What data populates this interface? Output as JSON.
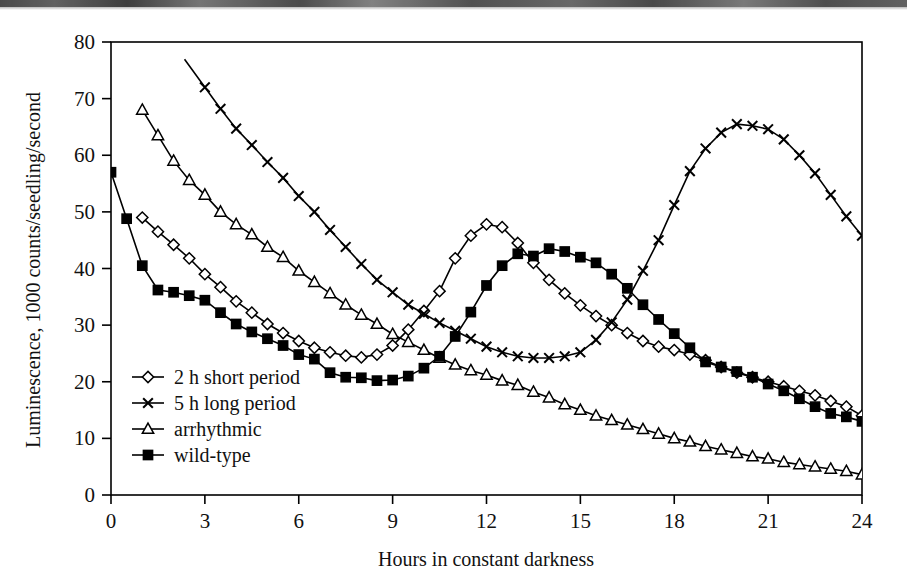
{
  "chart_data": {
    "type": "line",
    "title": "",
    "subtitle": "",
    "xlabel": "Hours in constant darkness",
    "ylabel": "Luminescence, 1000 counts/seedling/second",
    "xlim": [
      0,
      24
    ],
    "ylim": [
      0,
      80
    ],
    "xticks": [
      0,
      3,
      6,
      9,
      12,
      15,
      18,
      21,
      24
    ],
    "yticks": [
      0,
      10,
      20,
      30,
      40,
      50,
      60,
      70,
      80
    ],
    "xtick_labels": [
      "0",
      "3",
      "6",
      "9",
      "12",
      "15",
      "18",
      "21",
      "24"
    ],
    "ytick_labels": [
      "0",
      "10",
      "20",
      "30",
      "40",
      "50",
      "60",
      "70",
      "80"
    ],
    "grid": false,
    "legend_position": "inside-lower-left",
    "line_color": "#000000",
    "axis_color": "#000000",
    "series": [
      {
        "name": "2 h short period",
        "marker": "open-diamond",
        "x": [
          1.0,
          1.5,
          2.0,
          2.5,
          3.0,
          3.5,
          4.0,
          4.5,
          5.0,
          5.5,
          6.0,
          6.5,
          7.0,
          7.5,
          8.0,
          8.5,
          9.0,
          9.5,
          10.0,
          10.5,
          11.0,
          11.5,
          12.0,
          12.5,
          13.0,
          13.5,
          14.0,
          14.5,
          15.0,
          15.5,
          16.0,
          16.5,
          17.0,
          17.5,
          18.0,
          18.5,
          19.0,
          19.5,
          20.0,
          20.5,
          21.0,
          21.5,
          22.0,
          22.5,
          23.0,
          23.5,
          24.0
        ],
        "y": [
          49.0,
          46.5,
          44.2,
          41.8,
          39.0,
          36.7,
          34.2,
          32.2,
          30.2,
          28.6,
          27.2,
          26.0,
          25.2,
          24.6,
          24.3,
          24.8,
          26.4,
          29.2,
          32.5,
          36.0,
          41.8,
          45.8,
          47.8,
          47.3,
          44.5,
          41.0,
          38.0,
          35.6,
          33.5,
          31.6,
          30.0,
          28.6,
          27.2,
          26.2,
          25.6,
          24.8,
          23.8,
          22.6,
          21.6,
          20.8,
          20.0,
          19.2,
          18.4,
          17.6,
          16.6,
          15.6,
          14.0
        ]
      },
      {
        "name": "5 h long period",
        "marker": "cross-x",
        "x": [
          3.0,
          3.5,
          4.0,
          4.5,
          5.0,
          5.5,
          6.0,
          6.5,
          7.0,
          7.5,
          8.0,
          8.5,
          9.0,
          9.5,
          10.0,
          10.5,
          11.0,
          11.5,
          12.0,
          12.5,
          13.0,
          13.5,
          14.0,
          14.5,
          15.0,
          15.5,
          16.0,
          16.5,
          17.0,
          17.5,
          18.0,
          18.5,
          19.0,
          19.5,
          20.0,
          20.5,
          21.0,
          21.5,
          22.0,
          22.5,
          23.0,
          23.5,
          24.0
        ],
        "y": [
          72.0,
          68.2,
          64.7,
          61.8,
          58.8,
          56.0,
          52.8,
          50.0,
          46.8,
          43.8,
          40.8,
          38.0,
          35.8,
          33.6,
          32.0,
          30.4,
          29.0,
          27.6,
          26.2,
          25.2,
          24.5,
          24.2,
          24.2,
          24.5,
          25.2,
          27.4,
          30.5,
          34.5,
          39.6,
          45.0,
          51.2,
          57.2,
          61.2,
          64.0,
          65.5,
          65.2,
          64.6,
          62.8,
          60.0,
          56.8,
          53.0,
          49.2,
          45.8
        ]
      },
      {
        "name": "arrhythmic",
        "marker": "open-triangle",
        "x": [
          1.0,
          1.5,
          2.0,
          2.5,
          3.0,
          3.5,
          4.0,
          4.5,
          5.0,
          5.5,
          6.0,
          6.5,
          7.0,
          7.5,
          8.0,
          8.5,
          9.0,
          9.5,
          10.0,
          10.5,
          11.0,
          11.5,
          12.0,
          12.5,
          13.0,
          13.5,
          14.0,
          14.5,
          15.0,
          15.5,
          16.0,
          16.5,
          17.0,
          17.5,
          18.0,
          18.5,
          19.0,
          19.5,
          20.0,
          20.5,
          21.0,
          21.5,
          22.0,
          22.5,
          23.0,
          23.5,
          24.0
        ],
        "y": [
          68.0,
          63.5,
          59.0,
          55.6,
          53.0,
          50.0,
          47.8,
          46.0,
          43.8,
          42.0,
          39.6,
          37.6,
          35.6,
          33.6,
          31.8,
          30.2,
          28.4,
          27.0,
          25.6,
          24.2,
          23.0,
          22.0,
          21.2,
          20.2,
          19.4,
          18.2,
          17.2,
          16.0,
          15.0,
          14.0,
          13.2,
          12.4,
          11.6,
          10.8,
          10.0,
          9.4,
          8.6,
          8.0,
          7.4,
          6.8,
          6.4,
          5.8,
          5.4,
          5.0,
          4.6,
          4.2,
          3.6
        ]
      },
      {
        "name": "wild-type",
        "marker": "filled-square",
        "x": [
          0.0,
          0.5,
          1.0,
          1.5,
          2.0,
          2.5,
          3.0,
          3.5,
          4.0,
          4.5,
          5.0,
          5.5,
          6.0,
          6.5,
          7.0,
          7.5,
          8.0,
          8.5,
          9.0,
          9.5,
          10.0,
          10.5,
          11.0,
          11.5,
          12.0,
          12.5,
          13.0,
          13.5,
          14.0,
          14.5,
          15.0,
          15.5,
          16.0,
          16.5,
          17.0,
          17.5,
          18.0,
          18.5,
          19.0,
          19.5,
          20.0,
          20.5,
          21.0,
          21.5,
          22.0,
          22.5,
          23.0,
          23.5,
          24.0
        ],
        "y": [
          57.0,
          48.8,
          40.5,
          36.2,
          35.8,
          35.2,
          34.4,
          32.2,
          30.2,
          28.8,
          27.6,
          26.4,
          24.8,
          24.0,
          21.6,
          20.8,
          20.7,
          20.2,
          20.3,
          21.0,
          22.4,
          24.5,
          28.0,
          32.3,
          37.0,
          40.5,
          42.6,
          42.2,
          43.5,
          43.0,
          42.0,
          41.0,
          39.0,
          36.5,
          33.6,
          31.0,
          28.5,
          26.0,
          23.5,
          22.6,
          21.8,
          20.8,
          19.6,
          18.4,
          17.0,
          15.6,
          14.4,
          13.8,
          13.0
        ]
      }
    ],
    "legend_entries": [
      {
        "label": "2 h short period",
        "marker": "open-diamond"
      },
      {
        "label": "5 h long period",
        "marker": "cross-x"
      },
      {
        "label": "arrhythmic",
        "marker": "open-triangle"
      },
      {
        "label": "wild-type",
        "marker": "filled-square"
      }
    ]
  }
}
